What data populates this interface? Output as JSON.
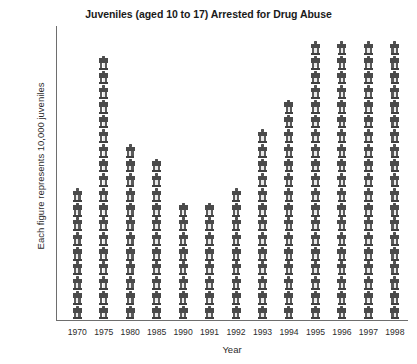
{
  "chart_data": {
    "type": "bar",
    "subtype": "pictograph",
    "title": "Juveniles (aged 10 to 17) Arrested for Drug Abuse",
    "xlabel": "Year",
    "ylabel": "Each figure represents 10,000 juveniles",
    "unit_per_figure": 10000,
    "grid": false,
    "legend": "none",
    "categories": [
      "1970",
      "1975",
      "1980",
      "1985",
      "1990",
      "1991",
      "1992",
      "1993",
      "1994",
      "1995",
      "1996",
      "1997",
      "1998"
    ],
    "figure_counts": [
      9,
      18,
      12,
      11,
      8,
      8,
      9,
      13,
      15,
      19,
      19,
      19,
      19
    ],
    "values": [
      90000,
      180000,
      120000,
      110000,
      80000,
      80000,
      90000,
      130000,
      150000,
      190000,
      190000,
      190000,
      190000
    ],
    "ylim": [
      0,
      200000
    ],
    "icon": "person-pictogram"
  },
  "colors": {
    "figure_fill": "#4a4a4a",
    "axis": "#6e6e6e",
    "text": "#2b2b2b",
    "background": "#ffffff"
  }
}
